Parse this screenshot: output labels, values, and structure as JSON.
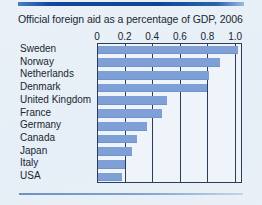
{
  "figure": {
    "background_color": "#e9f0f8",
    "top_rule_color": "#11489e",
    "bottom_rule_color": "#7ea4cf",
    "bar_color": "#7ea0d6",
    "axis_color": "#2c3d57"
  },
  "chart_data": {
    "type": "bar",
    "orientation": "horizontal",
    "title": "Official foreign aid as a percentage of GDP, 2006",
    "xlabel": "",
    "ylabel": "",
    "xlim": [
      0,
      1.05
    ],
    "axis_max_tick": 1.0,
    "grid": true,
    "legend": false,
    "tick_labels": [
      "0",
      "0.2",
      "0.4",
      "0.6",
      "0.8",
      "1.0"
    ],
    "tick_values": [
      0,
      0.2,
      0.4,
      0.6,
      0.8,
      1.0
    ],
    "categories": [
      "Sweden",
      "Norway",
      "Netherlands",
      "Denmark",
      "United Kingdom",
      "France",
      "Germany",
      "Canada",
      "Japan",
      "Italy",
      "USA"
    ],
    "values": [
      1.02,
      0.89,
      0.81,
      0.8,
      0.51,
      0.47,
      0.36,
      0.29,
      0.25,
      0.2,
      0.18
    ]
  }
}
